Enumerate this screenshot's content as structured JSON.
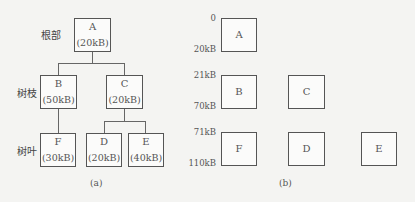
{
  "panel_a": {
    "caption": "(a)",
    "levels": {
      "root": "根部",
      "branch": "树枝",
      "leaf": "树叶"
    },
    "nodes": {
      "A": {
        "name": "A",
        "size": "(20kB)"
      },
      "B": {
        "name": "B",
        "size": "(50kB)"
      },
      "C": {
        "name": "C",
        "size": "(20kB)"
      },
      "D": {
        "name": "D",
        "size": "(20kB)"
      },
      "E": {
        "name": "E",
        "size": "(40kB)"
      },
      "F": {
        "name": "F",
        "size": "(30kB)"
      }
    },
    "edges": [
      [
        "A",
        "B"
      ],
      [
        "A",
        "C"
      ],
      [
        "B",
        "F"
      ],
      [
        "C",
        "D"
      ],
      [
        "C",
        "E"
      ]
    ]
  },
  "panel_b": {
    "caption": "(b)",
    "ticks": [
      "0",
      "20kB",
      "21kB",
      "70kB",
      "71kB",
      "110kB"
    ],
    "rows": [
      {
        "range": [
          "0",
          "20kB"
        ],
        "blocks": [
          "A"
        ]
      },
      {
        "range": [
          "21kB",
          "70kB"
        ],
        "blocks": [
          "B",
          "C"
        ]
      },
      {
        "range": [
          "71kB",
          "110kB"
        ],
        "blocks": [
          "F",
          "D",
          "E"
        ]
      }
    ]
  }
}
